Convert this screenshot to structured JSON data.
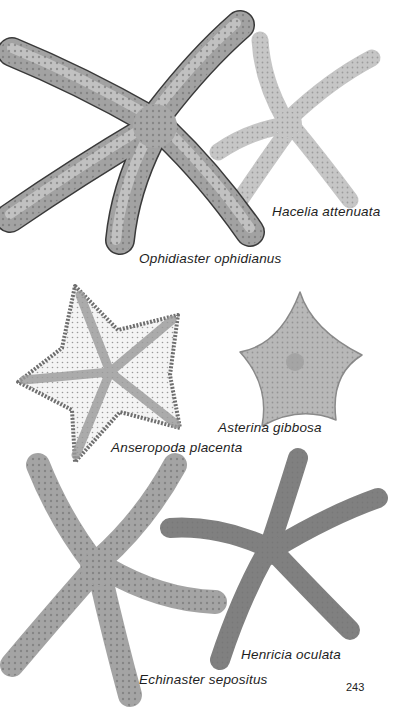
{
  "page": {
    "page_number": "243",
    "background": "#ffffff"
  },
  "specimens": [
    {
      "id": "ophidiaster",
      "name": "Ophidiaster ophidianus",
      "tone": "#9a9a9a"
    },
    {
      "id": "hacelia",
      "name": "Hacelia attenuata",
      "tone": "#c4c4c4"
    },
    {
      "id": "anseropoda",
      "name": "Anseropoda placenta",
      "tone": "#8c8c8c"
    },
    {
      "id": "asterina",
      "name": "Asterina gibbosa",
      "tone": "#b0b0b0"
    },
    {
      "id": "echinaster",
      "name": "Echinaster sepositus",
      "tone": "#a6a6a6"
    },
    {
      "id": "henricia",
      "name": "Henricia oculata",
      "tone": "#7e7e7e"
    }
  ]
}
